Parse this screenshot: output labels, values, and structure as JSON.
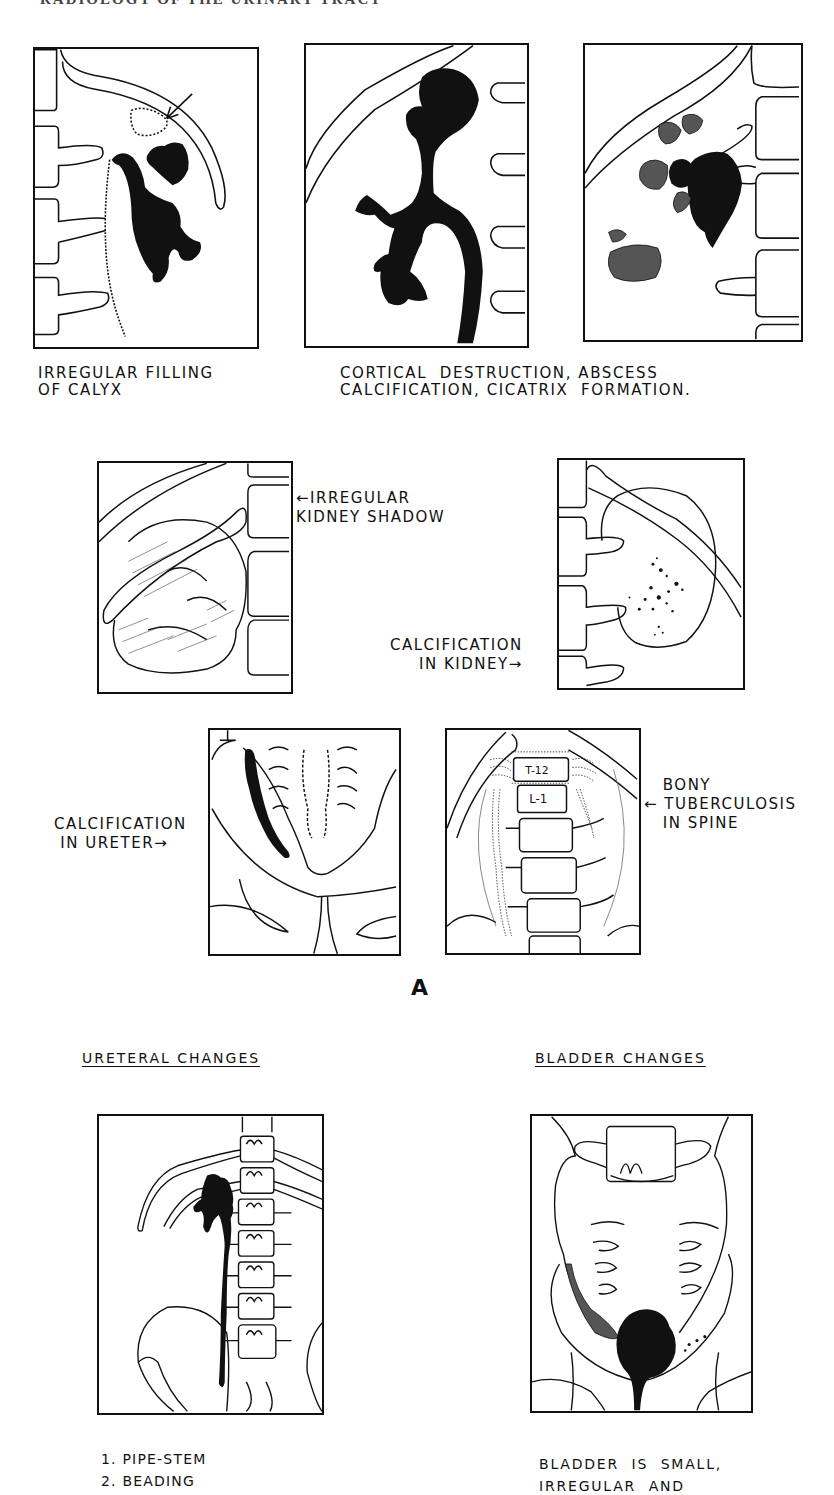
{
  "page": {
    "header": "RADIOLOGY OF THE URINARY TRACT",
    "figure_label": "A"
  },
  "top_row": {
    "panel1_caption_line1": "IRREGULAR FILLING",
    "panel1_caption_line2": "OF CALYX",
    "panel23_caption_line1": "CORTICAL  DESTRUCTION, ABSCESS",
    "panel23_caption_line2": "CALCIFICATION, CICATRIX  FORMATION."
  },
  "middle_row": {
    "kidney_shadow_label_line1": "IRREGULAR",
    "kidney_shadow_label_line2": "KIDNEY SHADOW",
    "kidney_calc_label_line1": "CALCIFICATION",
    "kidney_calc_label_line2": "IN KIDNEY",
    "ureter_calc_label_line1": "CALCIFICATION",
    "ureter_calc_label_line2": "IN URETER",
    "spine_label_line1": "BONY",
    "spine_label_line2": "TUBERCULOSIS",
    "spine_label_line3": "IN SPINE",
    "vertebra_t12": "T-12",
    "vertebra_l1": "L-1",
    "arrow_left": "←",
    "arrow_right": "→"
  },
  "bottom_row": {
    "ureteral_title": "URETERAL  CHANGES",
    "bladder_title": "BLADDER  CHANGES",
    "ureteral_items": [
      "1. PIPE-STEM",
      "2. BEADING"
    ],
    "bladder_caption_line1": "BLADDER  IS  SMALL,",
    "bladder_caption_line2": "IRREGULAR  AND"
  }
}
